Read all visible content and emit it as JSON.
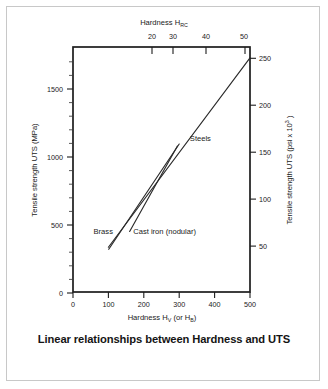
{
  "caption": "Linear relationships between Hardness and UTS",
  "chart_data": {
    "type": "line",
    "title": "",
    "caption": "Linear relationships between Hardness and UTS",
    "grid": false,
    "legend_position": "inline-annotations",
    "axes": {
      "bottom": {
        "label_prefix": "Hardness H",
        "label_sub1": "V",
        "label_mid": " (or H",
        "label_sub2": "B",
        "label_suffix": ")",
        "label_full": "Hardness HV (or HB)",
        "ticks": [
          0,
          100,
          200,
          300,
          400,
          500
        ],
        "tick_labels": [
          "0",
          "100",
          "200",
          "300",
          "400",
          "500"
        ],
        "range": [
          0,
          500
        ]
      },
      "top": {
        "label_prefix": "Hardness H",
        "label_sub": "RC",
        "label_full": "Hardness HRC",
        "ticks": [
          20,
          30,
          40,
          50
        ],
        "tick_labels": [
          "20",
          "30",
          "40",
          "50"
        ],
        "range": [
          9.5,
          52
        ],
        "tick_positions_hv": [
          235,
          295,
          390,
          500
        ]
      },
      "left": {
        "label": "Tensile strength UTS (MPa)",
        "ticks": [
          0,
          500,
          1000,
          1500
        ],
        "tick_labels": [
          "0",
          "500",
          "1000",
          "1500"
        ],
        "minor_step": 100,
        "range": [
          0,
          1800
        ]
      },
      "right": {
        "label_prefix": "Tensile strength UTS (psi x 10",
        "label_sup": "3",
        "label_suffix": " )",
        "label_full": "Tensile strength UTS (psi x 10^3 )",
        "ticks": [
          50,
          100,
          150,
          200,
          250
        ],
        "tick_labels": [
          "50",
          "100",
          "150",
          "200",
          "250"
        ],
        "range": [
          0,
          261
        ],
        "conversion_note": "MPa x 0.145 = psi x 10^3"
      }
    },
    "series": [
      {
        "name": "Steels",
        "label": "Steels",
        "label_at": {
          "hv": 330,
          "mpa": 1110
        },
        "points": [
          {
            "hv": 100,
            "mpa": 335
          },
          {
            "hv": 500,
            "mpa": 1720
          }
        ]
      },
      {
        "name": "Brass",
        "label": "Brass",
        "label_at": {
          "hv": 58,
          "mpa": 430
        },
        "points": [
          {
            "hv": 101,
            "mpa": 320
          },
          {
            "hv": 300,
            "mpa": 1090
          }
        ]
      },
      {
        "name": "Cast iron (nodular)",
        "label": "Cast iron (nodular)",
        "label_at": {
          "hv": 170,
          "mpa": 430
        },
        "points": [
          {
            "hv": 160,
            "mpa": 450
          },
          {
            "hv": 295,
            "mpa": 1075
          }
        ]
      }
    ]
  }
}
